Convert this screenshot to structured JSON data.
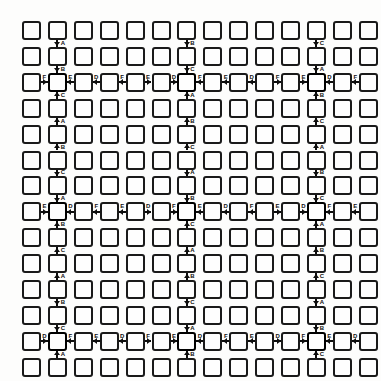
{
  "diagram": {
    "type": "node-grid",
    "background_color": "#fdfdfc",
    "node_stroke_color": "#1a1a1a",
    "node_fill_color": "#fefefe",
    "connector_color": "#0d0d0d",
    "label_color": "#111111",
    "grid": {
      "columns": 14,
      "rows": 14,
      "cell_size": 19,
      "pitch_x": 25.9,
      "pitch_y": 25.9,
      "origin_x": 22,
      "origin_y": 21,
      "node_shape": "rounded-square"
    },
    "hub_columns": [
      1,
      6,
      11
    ],
    "hub_rows": [
      2,
      7,
      12
    ],
    "vertical_label_cycle": [
      "A",
      "B",
      "C"
    ],
    "horizontal_label_cycle": [
      "D",
      "E",
      "F"
    ],
    "labels": {
      "A": "A",
      "B": "B",
      "C": "C",
      "D": "D",
      "E": "E",
      "F": "F"
    },
    "vertical_labels_by_hub_column": [
      [
        "A",
        "B",
        "C",
        "A",
        "B",
        "C",
        "A",
        "B",
        "C",
        "A",
        "B",
        "C",
        "A"
      ],
      [
        "B",
        "C",
        "A",
        "B",
        "C",
        "A",
        "B",
        "C",
        "A",
        "B",
        "C",
        "A",
        "B"
      ],
      [
        "C",
        "A",
        "B",
        "C",
        "A",
        "B",
        "C",
        "A",
        "B",
        "C",
        "A",
        "B",
        "C"
      ]
    ],
    "horizontal_labels_by_hub_row": [
      [
        "F",
        "E",
        "D",
        "F",
        "E",
        "D",
        "F",
        "E",
        "D",
        "F",
        "E",
        "D",
        "F"
      ],
      [
        "E",
        "D",
        "F",
        "E",
        "D",
        "F",
        "E",
        "D",
        "F",
        "E",
        "D",
        "F",
        "E"
      ],
      [
        "D",
        "F",
        "E",
        "D",
        "F",
        "E",
        "D",
        "F",
        "E",
        "D",
        "F",
        "E",
        "D"
      ]
    ],
    "node_count": 196,
    "hub_count": 9
  }
}
